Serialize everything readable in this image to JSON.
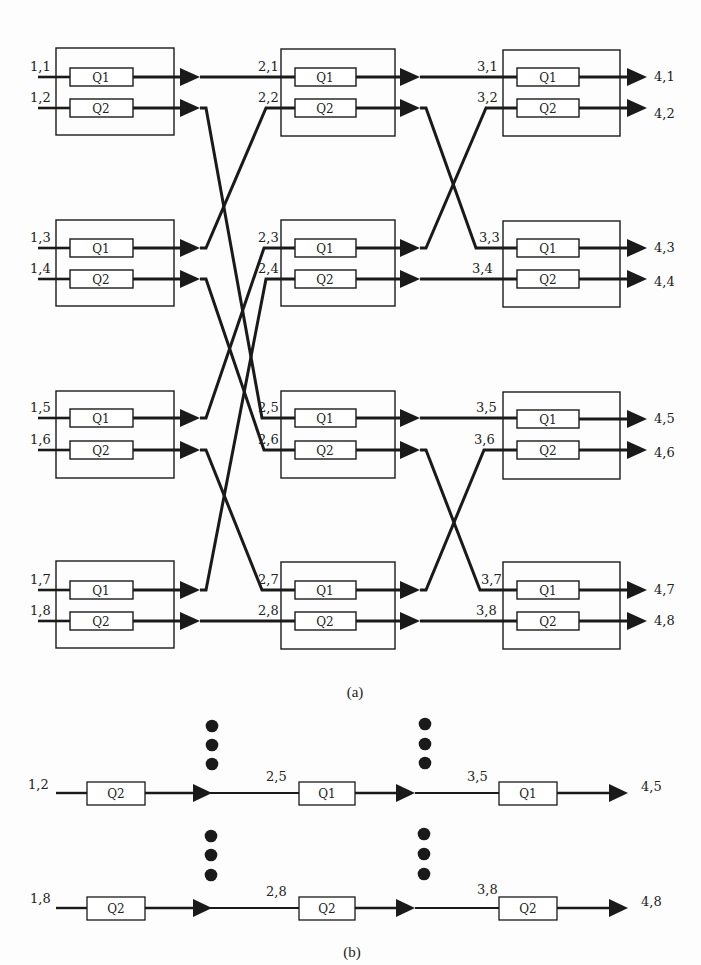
{
  "figure_a": {
    "caption": "(a)",
    "stages": [
      {
        "name": "stage-1",
        "switches": [
          {
            "inputs": [
              "1,1",
              "1,2"
            ],
            "queues": [
              "Q1",
              "Q2"
            ]
          },
          {
            "inputs": [
              "1,3",
              "1,4"
            ],
            "queues": [
              "Q1",
              "Q2"
            ]
          },
          {
            "inputs": [
              "1,5",
              "1,6"
            ],
            "queues": [
              "Q1",
              "Q2"
            ]
          },
          {
            "inputs": [
              "1,7",
              "1,8"
            ],
            "queues": [
              "Q1",
              "Q2"
            ]
          }
        ]
      },
      {
        "name": "stage-2",
        "switches": [
          {
            "inputs": [
              "2,1",
              "2,2"
            ],
            "queues": [
              "Q1",
              "Q2"
            ]
          },
          {
            "inputs": [
              "2,3",
              "2,4"
            ],
            "queues": [
              "Q1",
              "Q2"
            ]
          },
          {
            "inputs": [
              "2,5",
              "2,6"
            ],
            "queues": [
              "Q1",
              "Q2"
            ]
          },
          {
            "inputs": [
              "2,7",
              "2,8"
            ],
            "queues": [
              "Q1",
              "Q2"
            ]
          }
        ]
      },
      {
        "name": "stage-3",
        "switches": [
          {
            "inputs": [
              "3,1",
              "3,2"
            ],
            "queues": [
              "Q1",
              "Q2"
            ]
          },
          {
            "inputs": [
              "3,3",
              "3,4"
            ],
            "queues": [
              "Q1",
              "Q2"
            ]
          },
          {
            "inputs": [
              "3,5",
              "3,6"
            ],
            "queues": [
              "Q1",
              "Q2"
            ]
          },
          {
            "inputs": [
              "3,7",
              "3,8"
            ],
            "queues": [
              "Q1",
              "Q2"
            ]
          }
        ]
      }
    ],
    "outputs": [
      "4,1",
      "4,2",
      "4,3",
      "4,4",
      "4,5",
      "4,6",
      "4,7",
      "4,8"
    ],
    "links_stage1_to_stage2": [
      [
        1,
        1
      ],
      [
        2,
        5
      ],
      [
        3,
        2
      ],
      [
        4,
        6
      ],
      [
        5,
        3
      ],
      [
        6,
        7
      ],
      [
        7,
        4
      ],
      [
        8,
        8
      ]
    ],
    "links_stage2_to_stage3": [
      [
        1,
        1
      ],
      [
        2,
        3
      ],
      [
        3,
        2
      ],
      [
        4,
        4
      ],
      [
        5,
        5
      ],
      [
        6,
        7
      ],
      [
        7,
        6
      ],
      [
        8,
        8
      ]
    ]
  },
  "figure_b": {
    "caption": "(b)",
    "paths": [
      {
        "input": "1,2",
        "queue1": "Q2",
        "mid1": "2,5",
        "queue2": "Q1",
        "mid2": "3,5",
        "queue3": "Q1",
        "output": "4,5"
      },
      {
        "input": "1,8",
        "queue1": "Q2",
        "mid1": "2,8",
        "queue2": "Q2",
        "mid2": "3,8",
        "queue3": "Q2",
        "output": "4,8"
      }
    ],
    "ellipsis": "⋮"
  },
  "colors": {
    "ink": "#1a1a1a",
    "background": "#fdfdfd"
  }
}
